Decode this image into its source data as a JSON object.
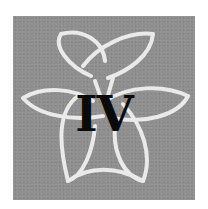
{
  "emblem": {
    "numeral": "IV",
    "background_color": "#8f8f8f",
    "knot_color": "#f2f2f2",
    "numeral_color": "#0a0a0a",
    "icon": "celtic-triquetra-knot-icon"
  }
}
